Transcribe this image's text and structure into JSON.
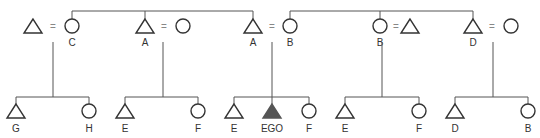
{
  "diagram": {
    "type": "kinship-chart",
    "colors": {
      "line": "#555555",
      "outline": "#333333",
      "ego_fill": "#555555",
      "background": "#ffffff"
    },
    "marriage_symbol": "=",
    "generation1": [
      {
        "id": "p1",
        "shape": "triangle",
        "x": 33,
        "label": ""
      },
      {
        "id": "p2",
        "shape": "circle",
        "x": 72,
        "label": "C"
      },
      {
        "id": "p3",
        "shape": "triangle",
        "x": 145,
        "label": "A"
      },
      {
        "id": "p4",
        "shape": "circle",
        "x": 183,
        "label": ""
      },
      {
        "id": "p5",
        "shape": "triangle",
        "x": 253,
        "label": "A"
      },
      {
        "id": "p6",
        "shape": "circle",
        "x": 290,
        "label": "B"
      },
      {
        "id": "p7",
        "shape": "circle",
        "x": 380,
        "label": "B"
      },
      {
        "id": "p8",
        "shape": "triangle",
        "x": 410,
        "label": ""
      },
      {
        "id": "p9",
        "shape": "triangle",
        "x": 473,
        "label": "D"
      },
      {
        "id": "p10",
        "shape": "circle",
        "x": 511,
        "label": ""
      }
    ],
    "generation2": [
      {
        "shape": "triangle",
        "x": 16,
        "label": "G"
      },
      {
        "shape": "circle",
        "x": 89,
        "label": "H"
      },
      {
        "shape": "triangle",
        "x": 125,
        "label": "E"
      },
      {
        "shape": "circle",
        "x": 198,
        "label": "F"
      },
      {
        "shape": "triangle",
        "x": 234,
        "label": "E"
      },
      {
        "shape": "triangle",
        "x": 272,
        "label": "EGO",
        "ego": true
      },
      {
        "shape": "circle",
        "x": 309,
        "label": "F"
      },
      {
        "shape": "triangle",
        "x": 345,
        "label": "E"
      },
      {
        "shape": "circle",
        "x": 419,
        "label": "F"
      },
      {
        "shape": "triangle",
        "x": 455,
        "label": "D"
      },
      {
        "shape": "circle",
        "x": 528,
        "label": "B"
      }
    ],
    "labels": {
      "c": "C",
      "a1": "A",
      "a2": "A",
      "b1": "B",
      "b2": "B",
      "d": "D",
      "g": "G",
      "h": "H",
      "e1": "E",
      "f1": "F",
      "e2": "E",
      "ego": "EGO",
      "f2": "F",
      "e3": "E",
      "f3": "F",
      "d2": "D",
      "b3": "B",
      "eq": "="
    }
  }
}
